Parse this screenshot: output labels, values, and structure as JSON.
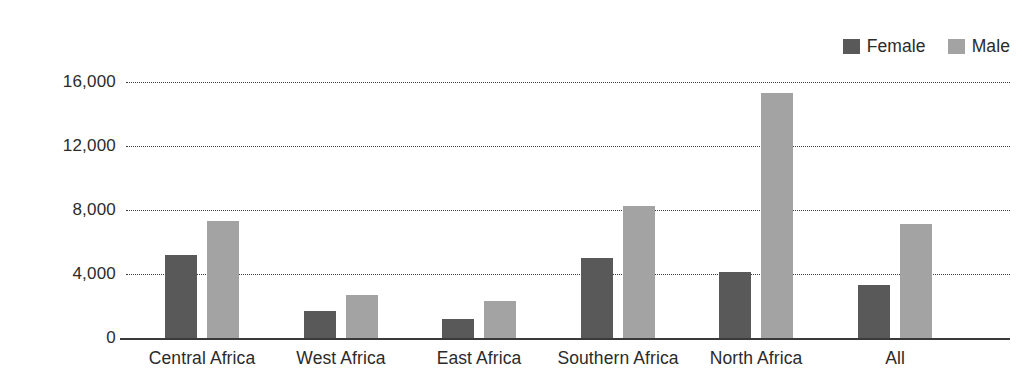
{
  "chart_data": {
    "type": "bar",
    "title": "",
    "subtitle": "",
    "xlabel": "",
    "ylabel": "",
    "categories": [
      "Central Africa",
      "West Africa",
      "East Africa",
      "Southern Africa",
      "North Africa",
      "All"
    ],
    "series": [
      {
        "name": "Female",
        "color": "#595959",
        "values": [
          5200,
          1700,
          1200,
          5000,
          4150,
          3300
        ]
      },
      {
        "name": "Male",
        "color": "#a3a3a3",
        "values": [
          7300,
          2700,
          2300,
          8250,
          15300,
          7100
        ]
      }
    ],
    "ylim": [
      0,
      16000
    ],
    "yticks": [
      0,
      4000,
      8000,
      12000,
      16000
    ],
    "ytick_labels": [
      "0",
      "4,000",
      "8,000",
      "12,000",
      "16,000"
    ],
    "grid": "horizontal-dotted",
    "legend_position": "top-right",
    "annotations": []
  },
  "legend": {
    "entries": [
      {
        "label": "Female",
        "color": "#595959"
      },
      {
        "label": "Male",
        "color": "#a3a3a3"
      }
    ]
  },
  "axis": {
    "y_tick_labels": [
      "16,000",
      "12,000",
      "8,000",
      "4,000",
      "0"
    ],
    "x_tick_labels": [
      "Central Africa",
      "West Africa",
      "East Africa",
      "Southern Africa",
      "North Africa",
      "All"
    ]
  },
  "colors": {
    "female": "#595959",
    "male": "#a3a3a3",
    "axis": "#3a3a3a",
    "text": "#2b2b2b",
    "background": "#ffffff"
  }
}
